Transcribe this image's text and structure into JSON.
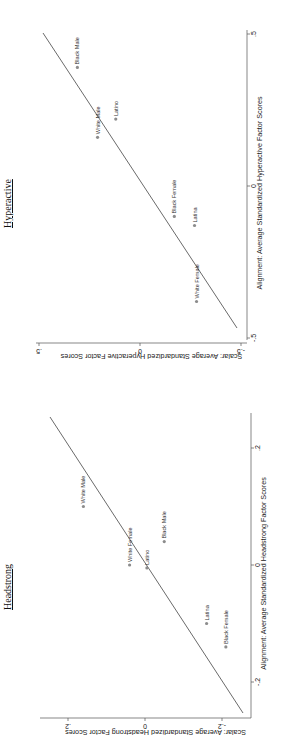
{
  "chart_data": [
    {
      "type": "scatter",
      "title": "Hyperactive",
      "xlabel": "Alignment: Average Standardized Hyperactive Factor Scores",
      "ylabel": "Scalar: Average Standardized Hyperactive Factor Scores",
      "xticks": [
        "-.5",
        "0",
        ".5"
      ],
      "yticks": [
        "-.5",
        "0",
        ".5"
      ],
      "xlim": [
        -0.5,
        0.5
      ],
      "ylim": [
        -0.5,
        0.5
      ],
      "reference_line": "45-degree line (y = x)",
      "orientation": "rotated 90 degrees counter-clockwise",
      "points": [
        {
          "label": "Black Male",
          "x": 0.39,
          "y": 0.31
        },
        {
          "label": "White Male",
          "x": 0.16,
          "y": 0.21
        },
        {
          "label": "Latino",
          "x": 0.22,
          "y": 0.12
        },
        {
          "label": "Black Female",
          "x": -0.1,
          "y": -0.17
        },
        {
          "label": "Latina",
          "x": -0.13,
          "y": -0.27
        },
        {
          "label": "White Female",
          "x": -0.38,
          "y": -0.28
        }
      ]
    },
    {
      "type": "scatter",
      "title": "Headstrong",
      "xlabel": "Alignment: Average Standardized Headstrong Factor Scores",
      "ylabel": "Scalar: Average Standardized Headstrong Factor Scores",
      "xticks": [
        "-.2",
        "0",
        ".2"
      ],
      "yticks": [
        "-.2",
        "0",
        ".2"
      ],
      "xlim": [
        -0.25,
        0.26
      ],
      "ylim": [
        -0.25,
        0.25
      ],
      "reference_line": "45-degree line (y = x)",
      "orientation": "rotated 90 degrees counter-clockwise",
      "points": [
        {
          "label": "White Male",
          "x": 0.1,
          "y": 0.16
        },
        {
          "label": "White Female",
          "x": 0.0,
          "y": 0.04
        },
        {
          "label": "Latino",
          "x": -0.005,
          "y": -0.005
        },
        {
          "label": "Black Male",
          "x": 0.04,
          "y": -0.05
        },
        {
          "label": "Latina",
          "x": -0.1,
          "y": -0.16
        },
        {
          "label": "Black Female",
          "x": -0.14,
          "y": -0.21
        }
      ]
    }
  ],
  "colors": {
    "marker": "#8c8c8c",
    "line": "#444444",
    "axis": "#555555"
  }
}
